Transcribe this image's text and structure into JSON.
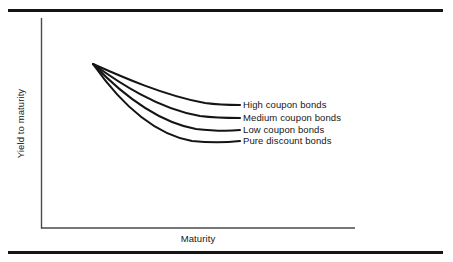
{
  "figure": {
    "background_color": "#ffffff",
    "frame_rule_color": "#151515",
    "axis_color": "#4a4a4a",
    "curve_color": "#141414"
  },
  "chart_data": {
    "type": "line",
    "title": "",
    "subtitle": "",
    "xlabel": "Maturity",
    "ylabel": "Yield to maturity",
    "grid": false,
    "legend_position": "inline-right-of-curve-ends",
    "axis_ticks": [],
    "xlim": [
      0,
      1
    ],
    "ylim": [
      0,
      1
    ],
    "annotations": [],
    "series": [
      {
        "name": "High coupon bonds",
        "label": "High coupon bonds",
        "path": "M93,64 C120,76 165,96 205,103 C220,105 232,105 240,105",
        "end_y": 105,
        "values": [
          1.0,
          0.82,
          0.66,
          0.56,
          0.5,
          0.47,
          0.46
        ]
      },
      {
        "name": "Medium coupon bonds",
        "label": "Medium coupon bonds",
        "path": "M93,64 C118,82 158,109 200,116 C216,118 231,118 240,118",
        "end_y": 118,
        "values": [
          1.0,
          0.74,
          0.54,
          0.42,
          0.36,
          0.33,
          0.32
        ]
      },
      {
        "name": "Low coupon bonds",
        "label": "Low coupon bonds",
        "path": "M93,64 C116,88 152,121 196,129 C214,131 231,131 240,130",
        "end_y": 130,
        "values": [
          1.0,
          0.67,
          0.43,
          0.3,
          0.23,
          0.2,
          0.19
        ]
      },
      {
        "name": "Pure discount bonds",
        "label": "Pure discount bonds",
        "path": "M93,64 C114,94 147,133 192,141 C212,143 231,142 240,141",
        "end_y": 141,
        "values": [
          1.0,
          0.6,
          0.33,
          0.19,
          0.12,
          0.09,
          0.08
        ]
      }
    ]
  },
  "axes": {
    "y_axis_title": "Yield to maturity",
    "x_axis_title": "Maturity",
    "y_axis_path": "M41.5,18 L41.5,228.5",
    "x_axis_path": "M41,228 L355,228"
  }
}
